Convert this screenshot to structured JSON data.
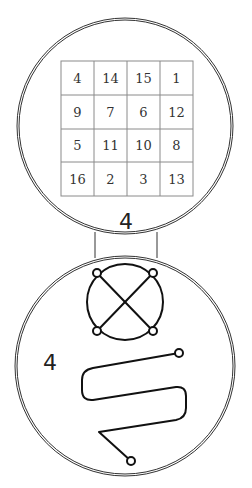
{
  "top_panel": {
    "magic_square": {
      "rows": [
        [
          "4",
          "14",
          "15",
          "1"
        ],
        [
          "9",
          "7",
          "6",
          "12"
        ],
        [
          "5",
          "11",
          "10",
          "8"
        ],
        [
          "16",
          "2",
          "3",
          "13"
        ]
      ]
    },
    "label": "4"
  },
  "bottom_panel": {
    "label": "4",
    "symbols": [
      "circle-with-x-sigil",
      "serpentine-line-sigil"
    ]
  },
  "colors": {
    "ink": "#111111",
    "outline": "#333333",
    "grid": "#8a8a8a",
    "background": "#ffffff"
  }
}
